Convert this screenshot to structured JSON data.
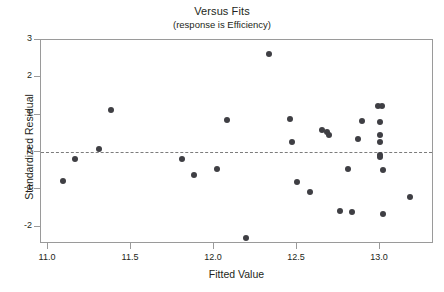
{
  "chart_data": {
    "type": "scatter",
    "title": "Versus Fits",
    "subtitle": "(response is Efficiency)",
    "xlabel": "Fitted Value",
    "ylabel": "Standardized Residual",
    "xlim": [
      10.96,
      13.33
    ],
    "ylim": [
      -2.46,
      3.0
    ],
    "xticks": [
      "11.0",
      "11.5",
      "12.0",
      "12.5",
      "13.0"
    ],
    "xtick_values": [
      11.0,
      11.5,
      12.0,
      12.5,
      13.0
    ],
    "yticks": [
      "3",
      "2",
      "1",
      "0",
      "-1",
      "-2"
    ],
    "ytick_values": [
      3,
      2,
      1,
      0,
      -1,
      -2
    ],
    "grid": false,
    "legend": null,
    "reference_line": {
      "y": 0,
      "style": "dashed",
      "color": "#7c7c7c"
    },
    "marker": {
      "shape": "circle",
      "color": "#3f3f44",
      "size": 6
    },
    "points": [
      {
        "x": 11.09,
        "y": -0.78
      },
      {
        "x": 11.16,
        "y": -0.19
      },
      {
        "x": 11.31,
        "y": 0.08
      },
      {
        "x": 11.38,
        "y": 1.13
      },
      {
        "x": 11.81,
        "y": -0.19
      },
      {
        "x": 11.88,
        "y": -0.62
      },
      {
        "x": 12.02,
        "y": -0.46
      },
      {
        "x": 12.08,
        "y": 0.86
      },
      {
        "x": 12.19,
        "y": -2.31
      },
      {
        "x": 12.33,
        "y": 2.63
      },
      {
        "x": 12.46,
        "y": 0.88
      },
      {
        "x": 12.47,
        "y": 0.27
      },
      {
        "x": 12.5,
        "y": -0.8
      },
      {
        "x": 12.58,
        "y": -1.07
      },
      {
        "x": 12.65,
        "y": 0.59
      },
      {
        "x": 12.68,
        "y": 0.54
      },
      {
        "x": 12.69,
        "y": 0.46
      },
      {
        "x": 12.76,
        "y": -1.57
      },
      {
        "x": 12.81,
        "y": -0.45
      },
      {
        "x": 12.83,
        "y": -1.62
      },
      {
        "x": 12.87,
        "y": 0.35
      },
      {
        "x": 12.89,
        "y": 0.83
      },
      {
        "x": 12.99,
        "y": 1.23
      },
      {
        "x": 13.0,
        "y": 0.8
      },
      {
        "x": 13.0,
        "y": 0.46
      },
      {
        "x": 13.0,
        "y": 0.27
      },
      {
        "x": 13.0,
        "y": -0.08
      },
      {
        "x": 13.0,
        "y": -0.13
      },
      {
        "x": 13.01,
        "y": 1.23
      },
      {
        "x": 13.02,
        "y": -0.48
      },
      {
        "x": 13.02,
        "y": -1.66
      },
      {
        "x": 13.18,
        "y": -1.21
      }
    ]
  }
}
